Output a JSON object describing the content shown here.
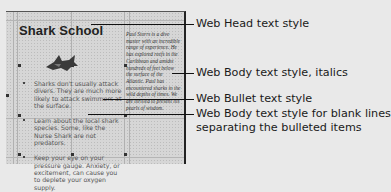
{
  "page": {
    "heading": "Shark School",
    "image_alt": "shark-illustration",
    "bullets": [
      "Sharks don't usually attack divers. They are much more likely to attack swimmers at the surface.",
      "Learn about the local shark species. Some, like the Nurse Shark are not predators.",
      "Keep your eye on your pressure gauge. Anxiety, or excitement, can cause you to deplete your oxygen supply."
    ],
    "sidebar_text": "Paul Storrs is a dive master with an incredible range of experience. He has explored reefs in the Caribbean and amidst hundreds of feet below the surface of the Atlantic. Paul has encountered sharks in the wild depths of times. We are thrilled to present his pearls of wisdom."
  },
  "callouts": [
    {
      "label": "Web Head text style"
    },
    {
      "label": "Web Body text style, italics"
    },
    {
      "label": "Web Bullet text style"
    },
    {
      "label": "Web Body text style for blank lines",
      "label2": "separating the bulleted items"
    }
  ],
  "colors": {
    "background": "#e9e9e9",
    "frame": "#d6d6d6",
    "lines": "#111111"
  }
}
